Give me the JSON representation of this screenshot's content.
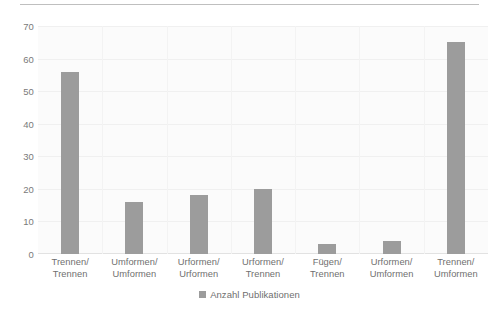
{
  "chart_data": {
    "type": "bar",
    "title": "",
    "subtitle": "",
    "xlabel": "",
    "ylabel": "",
    "ylim": [
      0,
      70
    ],
    "ytick_step": 10,
    "yticks": [
      0,
      10,
      20,
      30,
      40,
      50,
      60,
      70
    ],
    "grid": true,
    "legend_position": "bottom",
    "categories": [
      "Trennen/ Trennen",
      "Umformen/ Umformen",
      "Urformen/ Urformen",
      "Urformen/ Trennen",
      "Fügen/ Trennen",
      "Urformen/ Umformen",
      "Trennen/ Umformen"
    ],
    "category_lines": [
      [
        "Trennen/",
        "Trennen"
      ],
      [
        "Umformen/",
        "Umformen"
      ],
      [
        "Urformen/",
        "Urformen"
      ],
      [
        "Urformen/",
        "Trennen"
      ],
      [
        "Fügen/ Trennen",
        ""
      ],
      [
        "Urformen/",
        "Umformen"
      ],
      [
        "Trennen/",
        "Umformen"
      ]
    ],
    "series": [
      {
        "name": "Anzahl Publikationen",
        "values": [
          56,
          16,
          18,
          20,
          3,
          4,
          65
        ]
      }
    ]
  },
  "legend": {
    "marker_name": "series-color-swatch",
    "label": "Anzahl Publikationen"
  },
  "colors": {
    "bar": "#9c9c9c",
    "plot_background": "#fbfbfb",
    "gridline": "#f0f0f0",
    "baseline": "#e2e2e2",
    "tick_text": "#7a7a7a",
    "label_text": "#6f6f6f",
    "top_rule": "#bfbfbf"
  }
}
